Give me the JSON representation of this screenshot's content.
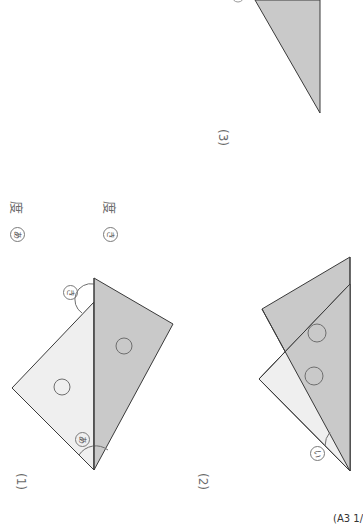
{
  "document": {
    "orientation": "rotated 90° clockwise",
    "page_ref": "(A3 1/"
  },
  "problems": [
    {
      "number": "(1)",
      "answers": [
        {
          "mark": "あ",
          "unit": "度"
        },
        {
          "mark": "き",
          "unit": "度"
        }
      ],
      "angle_labels": [
        "あ",
        "き"
      ]
    },
    {
      "number": "(2)",
      "angle_labels": [
        "い"
      ]
    },
    {
      "number": "(3)"
    }
  ],
  "colors": {
    "gray_fill": "#c9c9c9",
    "light_fill": "#efefef",
    "stroke": "#3a3a3a",
    "circle_stroke": "#6e6e6e"
  }
}
